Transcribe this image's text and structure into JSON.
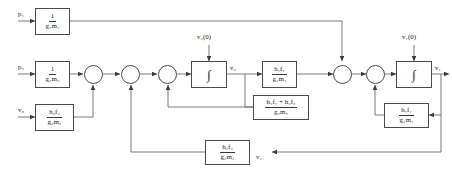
{
  "diagram": {
    "type": "control-block-diagram",
    "stroke_color": "#4a4a4a",
    "text_color": "#1a1a1a",
    "background": "#ffffff"
  },
  "inputs": {
    "p1": "p₁",
    "p2": "p₂",
    "v0": "v₀",
    "ic_v2": "v₂(0)",
    "ic_v1": "v₁(0)"
  },
  "outputs": {
    "v2": "v₂",
    "v1": "v₁",
    "v1_feedback_tap": "v₁"
  },
  "blocks": [
    {
      "id": "gain-p1",
      "numerator": "1",
      "denominator": "g₁m₁"
    },
    {
      "id": "gain-p2",
      "numerator": "1",
      "denominator": "g₂m₂"
    },
    {
      "id": "gain-v0",
      "numerator": "h₂f₂",
      "denominator": "g₂m₂"
    },
    {
      "id": "integrator-v2",
      "symbol": "∫"
    },
    {
      "id": "gain-h1f1-g1m1-forward",
      "numerator": "h₁f₁",
      "denominator": "g₁m₁"
    },
    {
      "id": "integrator-v1",
      "symbol": "∫"
    },
    {
      "id": "feedback-sum-h1f1-h2f2",
      "numerator": "h₁f₁ + h₂f₂",
      "denominator": "g₂m₂"
    },
    {
      "id": "feedback-h1f1-g1m1",
      "numerator": "h₁f₁",
      "denominator": "g₁m₁"
    },
    {
      "id": "feedback-h2f2-g2m2",
      "numerator": "h₂f₂",
      "denominator": "g₂m₂"
    }
  ],
  "summing_junctions": [
    {
      "id": "sum-1"
    },
    {
      "id": "sum-2"
    },
    {
      "id": "sum-3"
    },
    {
      "id": "sum-4"
    },
    {
      "id": "sum-5"
    }
  ]
}
